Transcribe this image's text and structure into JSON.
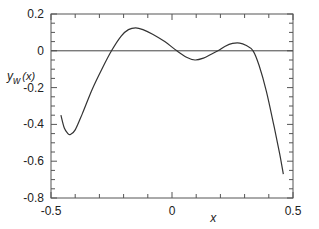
{
  "chart_data": {
    "type": "line",
    "title": "",
    "xlabel": "x",
    "ylabel": "y_w(x)",
    "ylabel_main": "y",
    "ylabel_sub": "w",
    "ylabel_arg": "(x)",
    "xlim": [
      -0.5,
      0.5
    ],
    "ylim": [
      -0.8,
      0.2
    ],
    "x_ticks": [
      -0.5,
      0,
      0.5
    ],
    "x_tick_labels": [
      "-0.5",
      "0",
      "0.5"
    ],
    "x_minor_step": 0.1,
    "y_ticks": [
      0.2,
      0,
      -0.2,
      -0.4,
      -0.6,
      -0.8
    ],
    "y_tick_labels": [
      "0.2",
      "0",
      "-0.2",
      "-0.4",
      "-0.6",
      "-0.8"
    ],
    "y_minor_step": 0.05,
    "grid": false,
    "reference_line_y": 0,
    "series": [
      {
        "name": "y_w(x)",
        "x": [
          -0.459,
          -0.445,
          -0.43,
          -0.42,
          -0.4,
          -0.37,
          -0.33,
          -0.29,
          -0.25,
          -0.21,
          -0.18,
          -0.15,
          -0.12,
          -0.08,
          -0.03,
          0.02,
          0.06,
          0.095,
          0.13,
          0.16,
          0.19,
          0.22,
          0.25,
          0.28,
          0.305,
          0.335,
          0.36,
          0.39,
          0.42,
          0.445,
          0.46
        ],
        "y": [
          -0.35,
          -0.42,
          -0.45,
          -0.455,
          -0.43,
          -0.34,
          -0.21,
          -0.1,
          0.0,
          0.08,
          0.115,
          0.125,
          0.115,
          0.09,
          0.05,
          0.0,
          -0.035,
          -0.05,
          -0.04,
          -0.02,
          0.0,
          0.025,
          0.04,
          0.042,
          0.03,
          0.0,
          -0.08,
          -0.22,
          -0.4,
          -0.56,
          -0.67
        ]
      }
    ]
  }
}
